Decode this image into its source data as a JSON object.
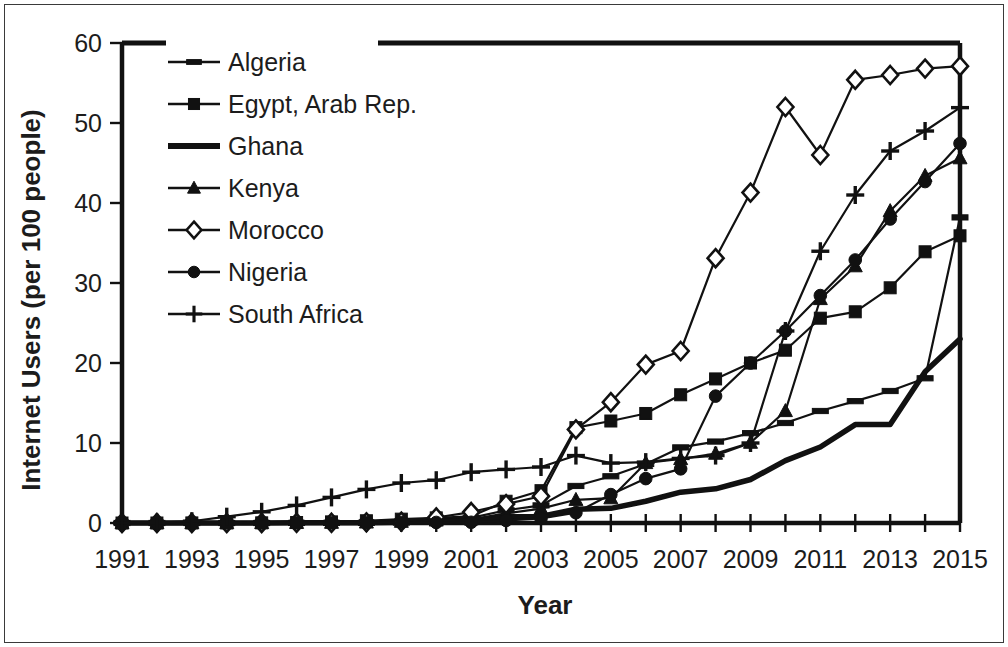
{
  "chart_data": {
    "type": "line",
    "title": "",
    "xlabel": "Year",
    "ylabel": "Internet Users (per 100 people)",
    "xlim": [
      1991,
      2015
    ],
    "ylim": [
      0,
      60
    ],
    "ytick_values": [
      0,
      10,
      20,
      30,
      40,
      50,
      60
    ],
    "ytick_labels": [
      "0",
      "10",
      "20",
      "30",
      "40",
      "50",
      "60"
    ],
    "xtick_values": [
      1991,
      1993,
      1995,
      1997,
      1999,
      2001,
      2003,
      2005,
      2007,
      2009,
      2011,
      2013,
      2015
    ],
    "xtick_labels": [
      "1991",
      "1993",
      "1995",
      "1997",
      "1999",
      "2001",
      "2003",
      "2005",
      "2007",
      "2009",
      "2011",
      "2013",
      "2015"
    ],
    "grid": false,
    "legend_position": "upper-left-inside",
    "x": [
      1991,
      1992,
      1993,
      1994,
      1995,
      1996,
      1997,
      1998,
      1999,
      2000,
      2001,
      2002,
      2003,
      2004,
      2005,
      2006,
      2007,
      2008,
      2009,
      2010,
      2011,
      2012,
      2013,
      2014,
      2015
    ],
    "series": [
      {
        "name": "Algeria",
        "marker": "dash",
        "values": [
          0,
          0,
          0,
          0,
          0,
          0.01,
          0.01,
          0.02,
          0.05,
          0.49,
          0.65,
          1.59,
          2.2,
          4.63,
          5.84,
          7.38,
          9.45,
          10.18,
          11.23,
          12.5,
          14.0,
          15.23,
          16.5,
          18.09,
          38.2
        ]
      },
      {
        "name": "Egypt, Arab Rep.",
        "marker": "square",
        "values": [
          0,
          0,
          0.01,
          0.01,
          0.02,
          0.06,
          0.14,
          0.28,
          0.48,
          0.64,
          0.84,
          2.72,
          4.04,
          11.92,
          12.75,
          13.69,
          16.03,
          18.01,
          20.0,
          21.6,
          25.6,
          26.4,
          29.4,
          33.9,
          35.9
        ]
      },
      {
        "name": "Ghana",
        "marker": "none",
        "values": [
          0,
          0,
          0,
          0,
          0.01,
          0.02,
          0.03,
          0.04,
          0.09,
          0.15,
          0.17,
          0.79,
          0.82,
          1.72,
          1.83,
          2.72,
          3.85,
          4.27,
          5.44,
          7.8,
          9.5,
          12.3,
          12.3,
          18.9,
          23.0
        ]
      },
      {
        "name": "Kenya",
        "marker": "triangle",
        "values": [
          0,
          0,
          0,
          0,
          0.01,
          0.02,
          0.04,
          0.07,
          0.16,
          0.32,
          0.45,
          1.2,
          1.8,
          2.9,
          3.1,
          7.5,
          8.0,
          8.67,
          10.04,
          14.0,
          28.0,
          32.1,
          39.0,
          43.4,
          45.6
        ]
      },
      {
        "name": "Morocco",
        "marker": "diamond",
        "values": [
          0,
          0,
          0,
          0,
          0.01,
          0.02,
          0.03,
          0.08,
          0.17,
          0.69,
          1.37,
          2.36,
          3.35,
          11.7,
          15.1,
          19.8,
          21.5,
          33.1,
          41.3,
          52.0,
          46.0,
          55.4,
          56.0,
          56.8,
          57.1
        ]
      },
      {
        "name": "Nigeria",
        "marker": "circle",
        "values": [
          0,
          0,
          0,
          0,
          0.01,
          0.02,
          0.02,
          0.04,
          0.06,
          0.07,
          0.09,
          0.32,
          0.56,
          1.29,
          3.55,
          5.55,
          6.77,
          15.86,
          20.0,
          24.0,
          28.43,
          32.88,
          38.0,
          42.68,
          47.44
        ]
      },
      {
        "name": "South Africa",
        "marker": "plus",
        "values": [
          0.01,
          0.04,
          0.22,
          0.79,
          1.4,
          2.2,
          3.2,
          4.2,
          5.0,
          5.35,
          6.35,
          6.7,
          7.0,
          8.43,
          7.49,
          7.61,
          8.07,
          8.43,
          10.0,
          24.0,
          33.97,
          41.0,
          46.5,
          49.0,
          51.92
        ]
      }
    ]
  },
  "legend": {
    "items": [
      {
        "label": "Algeria",
        "marker": "dash"
      },
      {
        "label": "Egypt, Arab Rep.",
        "marker": "square"
      },
      {
        "label": "Ghana",
        "marker": "none"
      },
      {
        "label": "Kenya",
        "marker": "triangle"
      },
      {
        "label": "Morocco",
        "marker": "diamond"
      },
      {
        "label": "Nigeria",
        "marker": "circle"
      },
      {
        "label": "South Africa",
        "marker": "plus"
      }
    ]
  },
  "colors": {
    "ink": "#111111",
    "background": "#ffffff",
    "frame": "#3a3a3a"
  }
}
